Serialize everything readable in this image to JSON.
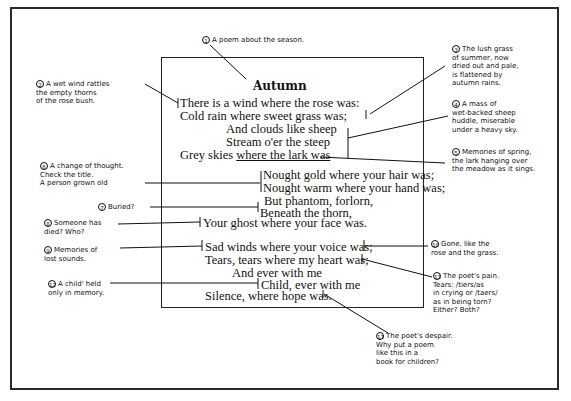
{
  "poem": {
    "title": "Autumn",
    "stanzas": [
      {
        "lines": [
          "There is a wind where the rose was:",
          "Cold rain where sweet grass was;",
          "And clouds like sheep",
          "Stream o'er the steep",
          "Grey skies ",
          "where the lark was"
        ]
      },
      {
        "lines": [
          "Nought gold where your hair was;",
          "Nought warm where your hand was;",
          "But phantom, forlorn,",
          "Beneath the thorn,",
          "Your ghost where your face was."
        ]
      },
      {
        "lines": [
          "Sad winds where your voice was;",
          "Tears, tears where my heart was;",
          "And ever with me",
          "Child, ever with me",
          "Silence, where hope was."
        ]
      }
    ]
  },
  "annotations": [
    {
      "number": "1",
      "text": "A poem about the season."
    },
    {
      "number": "2",
      "text": "A wet wind rattles\nthe empty thorns\nof the rose bush."
    },
    {
      "number": "3",
      "text": "The lush grass\nof summer, now\ndried out and pale,\nis flattened by\nautumn rains."
    },
    {
      "number": "4",
      "text": "A mass of\nwet-backed sheep\nhuddle, miserable\nunder a heavy sky."
    },
    {
      "number": "5",
      "text": "Memories of spring,\nthe lark hanging over\nthe meadow as it sings."
    },
    {
      "number": "6",
      "text": "A change of thought.\nCheck the title.\nA person grown old"
    },
    {
      "number": "7",
      "text": "Buried?"
    },
    {
      "number": "8",
      "text": "Someone has\ndied? Who?"
    },
    {
      "number": "9",
      "text": "Memories of\nlost sounds."
    },
    {
      "number": "10",
      "text": "Gone, like the\nrose and the grass."
    },
    {
      "number": "11",
      "text": "The poet's pain.\nTears: /tiers/as\nin crying or /taers/\nas in being torn?\nEither? Both?"
    },
    {
      "number": "12",
      "text": "A child' held\nonly in memory."
    },
    {
      "number": "13",
      "text": "The poet's despair.\nWhy put a poem\nlike this in a\nbook for children?"
    }
  ]
}
